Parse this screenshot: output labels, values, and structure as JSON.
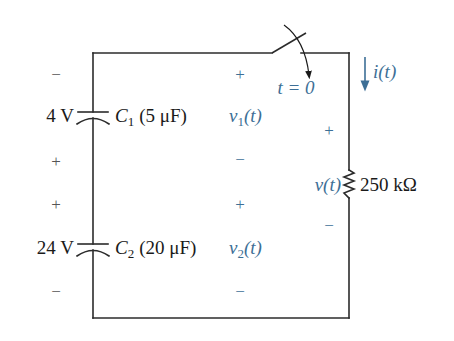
{
  "colors": {
    "wire": "#2b2b2b",
    "text": "#1a1a1a",
    "annotation_blue": "#3d6f96"
  },
  "capacitor_1": {
    "voltage_label": "4 V",
    "name": "C",
    "subscript": "1",
    "value_label": "(5 μF)",
    "polarity_top": "−",
    "polarity_bottom": "+"
  },
  "capacitor_2": {
    "voltage_label": "24 V",
    "name": "C",
    "subscript": "2",
    "value_label": "(20 μF)",
    "polarity_top": "+",
    "polarity_bottom": "−"
  },
  "voltage_1": {
    "name": "v",
    "subscript": "1",
    "arg": "(t)",
    "polarity_top": "+",
    "polarity_bottom": "−"
  },
  "voltage_2": {
    "name": "v",
    "subscript": "2",
    "arg": "(t)",
    "polarity_top": "+",
    "polarity_bottom": "−"
  },
  "switch": {
    "time_label": "t = 0"
  },
  "current": {
    "label": "i(t)",
    "direction": "down"
  },
  "resistor": {
    "voltage_label": "v(t)",
    "value_label": "250 kΩ",
    "polarity_top": "+",
    "polarity_bottom": "−"
  }
}
